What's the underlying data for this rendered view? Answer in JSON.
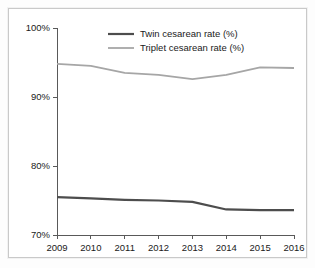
{
  "chart_data": {
    "type": "line",
    "title": "",
    "subtitle": "",
    "xlabel": "",
    "ylabel": "",
    "x": [
      "2009",
      "2010",
      "2011",
      "2012",
      "2013",
      "2014",
      "2015",
      "2016"
    ],
    "categories": [
      "2009",
      "2010",
      "2011",
      "2012",
      "2013",
      "2014",
      "2015",
      "2016"
    ],
    "series": [
      {
        "name": "Twin cesarean rate (%)",
        "color": "#4d4d4d",
        "line_width": 2.2,
        "values": [
          75.5,
          75.3,
          75.1,
          75.0,
          74.8,
          73.7,
          73.6,
          73.6
        ]
      },
      {
        "name": "Triplet cesarean rate (%)",
        "color": "#a6a6a6",
        "line_width": 1.8,
        "values": [
          94.8,
          94.5,
          93.5,
          93.2,
          92.6,
          93.2,
          94.3,
          94.2
        ]
      }
    ],
    "ylim": [
      70,
      100
    ],
    "xlim": [
      "2009",
      "2016"
    ],
    "ytick_labels": [
      "100%",
      "90%",
      "80%",
      "70%"
    ],
    "ytick_values": [
      100,
      90,
      80,
      70
    ],
    "xtick_labels": [
      "2009",
      "2010",
      "2011",
      "2012",
      "2013",
      "2014",
      "2015",
      "2016"
    ],
    "grid": false,
    "legend_position": "top-center"
  },
  "axes": {
    "y_ticks": [
      {
        "label": "100%",
        "value": 100
      },
      {
        "label": "90%",
        "value": 90
      },
      {
        "label": "80%",
        "value": 80
      },
      {
        "label": "70%",
        "value": 70
      }
    ],
    "x_ticks": [
      {
        "label": "2009"
      },
      {
        "label": "2010"
      },
      {
        "label": "2011"
      },
      {
        "label": "2012"
      },
      {
        "label": "2013"
      },
      {
        "label": "2014"
      },
      {
        "label": "2015"
      },
      {
        "label": "2016"
      }
    ]
  },
  "legend": {
    "entries": [
      {
        "label": "Twin cesarean rate (%)",
        "color": "#4d4d4d"
      },
      {
        "label": "Triplet cesarean rate (%)",
        "color": "#a6a6a6"
      }
    ]
  },
  "colors": {
    "twin": "#4d4d4d",
    "triplet": "#a6a6a6",
    "axis": "#595959",
    "text": "#1a1a1a",
    "frame": "#c9c9c9",
    "background": "#ffffff"
  }
}
